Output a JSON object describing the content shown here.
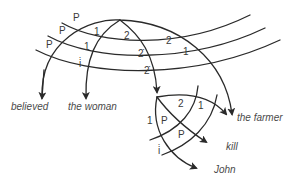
{
  "diagram": {
    "words": {
      "believed": "believed",
      "the_woman": "the woman",
      "the_farmer": "the farmer",
      "kill": "kill",
      "john": "John"
    },
    "upper_labels": {
      "p1": "P",
      "p2": "P",
      "p3": "P",
      "a1": "1",
      "a2": "1",
      "a3": "i̇",
      "b1": "2",
      "b2": "2̇",
      "b3": "2̇",
      "c1": "2",
      "c2": "1"
    },
    "lower_labels": {
      "l1": "1",
      "l2": "P",
      "l3": "2",
      "l4": "1",
      "l5": "P",
      "l6": "i̇"
    },
    "colors": {
      "stroke": "#2a2a2a",
      "text": "#3a3a3a"
    }
  }
}
